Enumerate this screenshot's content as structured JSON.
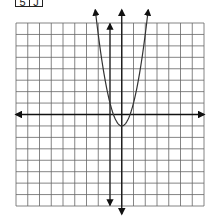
{
  "label": {
    "cells": [
      "5",
      "J"
    ]
  },
  "chart_data": {
    "type": "line",
    "title": "",
    "xlabel": "",
    "ylabel": "",
    "grid": true,
    "grid_cells": {
      "columns": 16,
      "rows": 16
    },
    "xlim": [
      -9,
      7
    ],
    "ylim": [
      -8,
      8
    ],
    "axes": {
      "x_axis_y": 0,
      "y_axis_x": 0,
      "arrows": true
    },
    "series": [
      {
        "name": "parabola",
        "equation": "y = 2x^2 - 1",
        "vertex": [
          0,
          -1
        ],
        "opens": "up",
        "color": "#333333",
        "arrows": true
      },
      {
        "name": "vertical line",
        "equation": "x = -1",
        "color": "#333333",
        "arrows": true
      }
    ],
    "tick_labels": []
  },
  "colors": {
    "grid": "#555555",
    "axis": "#111111",
    "curve": "#333333"
  }
}
